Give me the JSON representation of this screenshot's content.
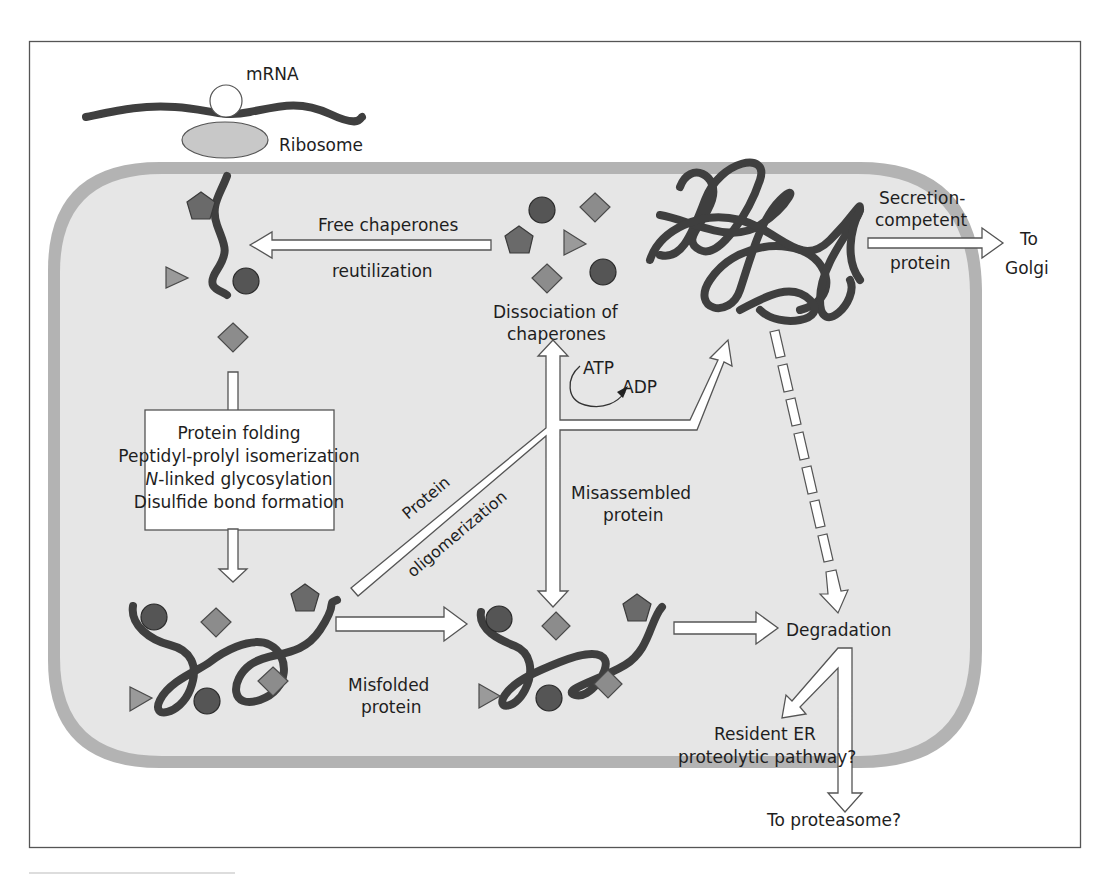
{
  "figure": {
    "colors": {
      "background": "#ffffff",
      "frame": "#555555",
      "er_lumen": "#e6e6e6",
      "er_membrane": "#b3b3b3",
      "polypeptide": "#3f3f3f",
      "arrow_fill": "#ffffff"
    }
  },
  "labels": {
    "mrna": "mRNA",
    "ribosome": "Ribosome",
    "free_chaperones": "Free chaperones",
    "reutilization": "reutilization",
    "dissociation_line1": "Dissociation of",
    "dissociation_line2": "chaperones",
    "atp": "ATP",
    "adp": "ADP",
    "secretion_line1": "Secretion-",
    "secretion_line2": "competent",
    "secretion_line3": "protein",
    "to_golgi_line1": "To",
    "to_golgi_line2": "Golgi",
    "process_box": [
      "Protein folding",
      "Peptidyl-prolyl isomerization",
      "-linked glycosylation",
      "Disulfide bond formation"
    ],
    "process_box_italic_prefix": "N",
    "oligomerization_line1": "Protein",
    "oligomerization_line2": "oligomerization",
    "misassembled_line1": "Misassembled",
    "misassembled_line2": "protein",
    "misfolded_line1": "Misfolded",
    "misfolded_line2": "protein",
    "degradation": "Degradation",
    "resident_line1": "Resident ER",
    "resident_line2": "proteolytic pathway?",
    "to_proteasome": "To proteasome?"
  },
  "legend_shapes": [
    "circle-chaperone",
    "diamond-chaperone",
    "pentagon-chaperone",
    "triangle-chaperone"
  ]
}
